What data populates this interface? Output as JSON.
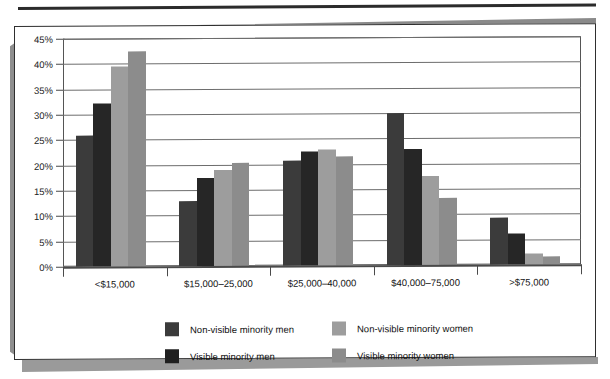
{
  "chart_data": {
    "type": "bar",
    "title": "",
    "subtitle": "",
    "xlabel": "",
    "ylabel": "",
    "ylim": [
      0,
      45
    ],
    "ytick_step": 5,
    "ytick_labels": [
      "45%",
      "40%",
      "35%",
      "30%",
      "25%",
      "20%",
      "15%",
      "10%",
      "5%",
      "0%"
    ],
    "ytick_values": [
      45,
      40,
      35,
      30,
      25,
      20,
      15,
      10,
      5,
      0
    ],
    "grid": true,
    "grid_axis": "y",
    "legend_position": "bottom",
    "categories": [
      "<$15,000",
      "$15,000–25,000",
      "$25,000–40,000",
      "$40,000–75,000",
      ">$75,000"
    ],
    "series": [
      {
        "name": "Non-visible minority men",
        "color": "#3b3b3b",
        "values": [
          25.8,
          12.8,
          20.7,
          30.0,
          9.3
        ]
      },
      {
        "name": "Visible minority men",
        "color": "#262626",
        "values": [
          32.1,
          17.3,
          22.5,
          22.8,
          6.2
        ]
      },
      {
        "name": "Non-visible minority women",
        "color": "#9d9d9d",
        "values": [
          39.4,
          19.0,
          22.8,
          17.5,
          2.1
        ]
      },
      {
        "name": "Visible minority women",
        "color": "#8c8c8c",
        "values": [
          42.5,
          20.3,
          21.5,
          13.2,
          1.6
        ]
      }
    ]
  },
  "legend": {
    "entries": [
      {
        "label": "Non-visible minority men",
        "swatch_color": "#3b3b3b"
      },
      {
        "label": "Non-visible minority women",
        "swatch_color": "#9d9d9d"
      },
      {
        "label": "Visible minority men",
        "swatch_color": "#1f1f1f"
      },
      {
        "label": "Visible minority women",
        "swatch_color": "#8c8c8c"
      }
    ]
  },
  "page": {
    "border_color": "#2f2f2f",
    "shadow_color": "#8f8f8f",
    "rule_color": "#2b2b2b",
    "background": "#ffffff"
  }
}
